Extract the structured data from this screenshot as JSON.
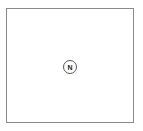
{
  "diagram": {
    "node": {
      "label": "N"
    },
    "colors": {
      "border": "#8a8a8a",
      "node_border": "#555555",
      "text": "#222222"
    }
  }
}
